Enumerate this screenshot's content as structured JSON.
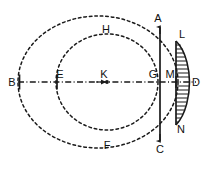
{
  "figure": {
    "kind": "geometry-diagram",
    "width": 205,
    "height": 170,
    "background_color": "#ffffff",
    "stroke_color": "#1a1a1a",
    "label_color": "#111111"
  },
  "axis": {
    "name": "horizontal-center-line",
    "style": "dash-dot",
    "y": 82,
    "x_start": 18,
    "x_end": 196,
    "tick_points": [
      "B",
      "E"
    ],
    "dot_points": [
      "K"
    ],
    "arrow_at": "K"
  },
  "ellipses": [
    {
      "name": "outer-ellipse",
      "style": "dashed",
      "cx": 98,
      "cy": 82,
      "rx": 80,
      "ry": 66,
      "top_label": null,
      "bottom_label": null,
      "left_label": "B"
    },
    {
      "name": "inner-ellipse",
      "style": "dashed",
      "cx": 107,
      "cy": 82,
      "rx": 51,
      "ry": 48,
      "top_label": "H",
      "bottom_label": "F",
      "left_label": "E"
    }
  ],
  "chord": {
    "name": "vertical-chord-AC",
    "style": "solid",
    "x": 160,
    "y_top": 26,
    "y_bottom": 140,
    "top_label": "A",
    "bottom_label": "C",
    "crosses_axis_at": "G"
  },
  "lens": {
    "name": "lens-shape-LDN",
    "style": "solid-hatched",
    "chord_x": 176,
    "y_top": 40,
    "y_bottom": 126,
    "apex_x": 189,
    "apex_y": 82,
    "top_label": "L",
    "bottom_label": "N",
    "apex_label": "D",
    "axis_label": "M"
  },
  "labels": [
    {
      "id": "A",
      "text": "A",
      "x": 158,
      "y": 22,
      "anchor": "middle"
    },
    {
      "id": "B",
      "text": "B",
      "x": 12,
      "y": 86,
      "anchor": "middle"
    },
    {
      "id": "C",
      "text": "C",
      "x": 160,
      "y": 153,
      "anchor": "middle"
    },
    {
      "id": "D",
      "text": "D",
      "x": 196,
      "y": 86,
      "anchor": "middle"
    },
    {
      "id": "E",
      "text": "E",
      "x": 60,
      "y": 78,
      "anchor": "middle"
    },
    {
      "id": "F",
      "text": "F",
      "x": 107,
      "y": 149,
      "anchor": "middle"
    },
    {
      "id": "G",
      "text": "G",
      "x": 153,
      "y": 78,
      "anchor": "middle"
    },
    {
      "id": "H",
      "text": "H",
      "x": 106,
      "y": 33,
      "anchor": "middle"
    },
    {
      "id": "K",
      "text": "K",
      "x": 104,
      "y": 78,
      "anchor": "middle"
    },
    {
      "id": "L",
      "text": "L",
      "x": 182,
      "y": 38,
      "anchor": "middle"
    },
    {
      "id": "M",
      "text": "M",
      "x": 170,
      "y": 78,
      "anchor": "middle"
    },
    {
      "id": "N",
      "text": "N",
      "x": 181,
      "y": 133,
      "anchor": "middle"
    }
  ]
}
